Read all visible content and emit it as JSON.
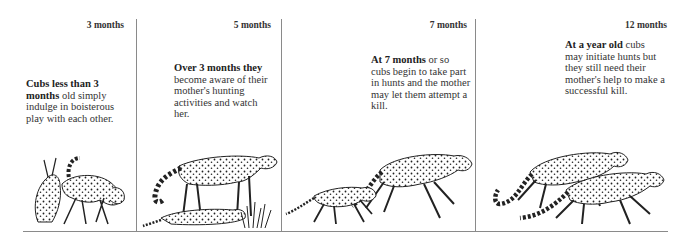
{
  "panels": [
    {
      "age_label": "3 months",
      "caption_bold": "Cubs less than 3 months",
      "caption_rest": " old simply indulge in boisterous play with each other.",
      "illustration": "two-cubs-playing-icon"
    },
    {
      "age_label": "5 months",
      "caption_bold": "Over 3 months they",
      "caption_rest": " become aware of their mother's hunting activities and watch her.",
      "illustration": "mother-and-crouching-cub-icon"
    },
    {
      "age_label": "7 months",
      "caption_bold": "At 7 months",
      "caption_rest": " or so cubs begin to take part in hunts and the mother may let them attempt a kill.",
      "illustration": "mother-and-cub-running-icon"
    },
    {
      "age_label": "12 months",
      "caption_bold": "At a year old",
      "caption_rest": " cubs may initiate hunts but they still need their mother's help to make a successful kill.",
      "illustration": "two-cheetahs-sprinting-icon"
    }
  ],
  "colors": {
    "rule": "#8a8a8a",
    "text": "#333333",
    "background": "#ffffff"
  }
}
